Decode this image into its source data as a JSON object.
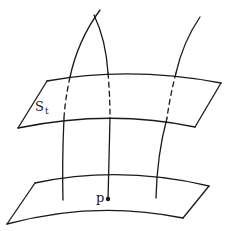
{
  "figure": {
    "type": "geometric-sketch",
    "colors": {
      "ink": "#1a1a1a",
      "background": "#ffffff"
    }
  },
  "labels": {
    "surface_upper": {
      "main": "S",
      "subscript": "t"
    },
    "point": "p"
  },
  "surfaces": [
    {
      "id": "upper",
      "label": "S_t"
    },
    {
      "id": "lower",
      "label": ""
    }
  ],
  "curves": [
    {
      "id": "left",
      "passes_through": [
        "upper",
        "lower"
      ],
      "dashed_behind": "upper"
    },
    {
      "id": "middle",
      "passes_through": [
        "upper",
        "lower"
      ],
      "dashed_behind": "upper",
      "ends_at": "p"
    },
    {
      "id": "right",
      "passes_through": [
        "upper",
        "lower"
      ],
      "dashed_behind": "upper"
    }
  ]
}
